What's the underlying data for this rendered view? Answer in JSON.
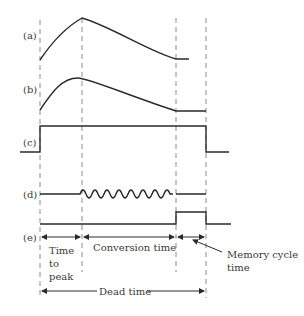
{
  "diagram": {
    "signal_labels": [
      "(a)",
      "(b)",
      "(c)",
      "(d)",
      "(e)"
    ],
    "intervals": {
      "time_to_peak": [
        "Time",
        "to",
        "peak"
      ],
      "conversion_time": "Conversion time",
      "memory_cycle_time": [
        "Memory cycle",
        "time"
      ],
      "dead_time": "Dead time"
    },
    "colors": {
      "line": "#2a2a2a",
      "dashed": "#8a8a8a",
      "text": "#3a3a3a",
      "background": "#ffffff"
    }
  }
}
